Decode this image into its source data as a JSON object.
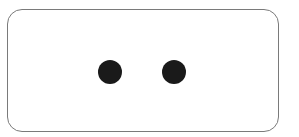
{
  "card": {
    "border_color": "#7a7a7a",
    "background": "#ffffff"
  },
  "dots": [
    {
      "name": "dot-left",
      "color": "#1a1a1a"
    },
    {
      "name": "dot-right",
      "color": "#1a1a1a"
    }
  ]
}
